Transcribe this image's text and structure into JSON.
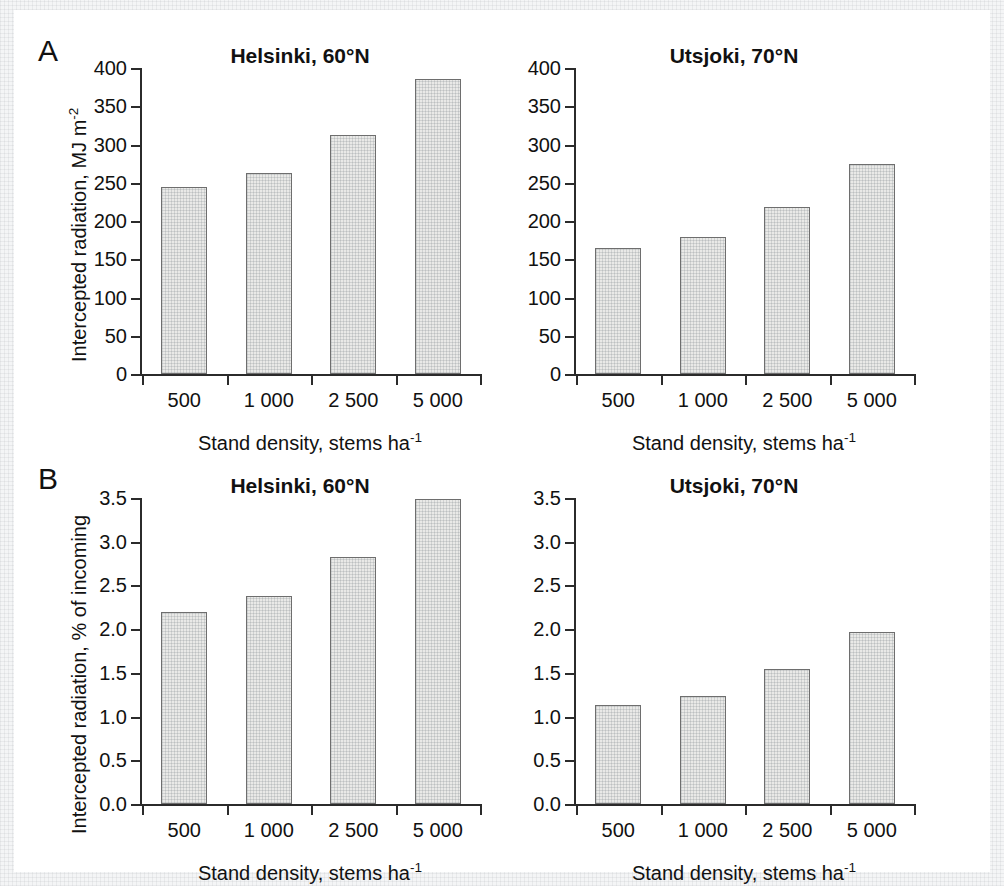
{
  "figure": {
    "panels": [
      {
        "letter": "A"
      },
      {
        "letter": "B"
      }
    ]
  },
  "axis_titles": {
    "x": "Stand density, stems ha",
    "x_sup": "-1",
    "y_a_pre": "Intercepted radiation, MJ m",
    "y_a_sup": "-2",
    "y_b": "Intercepted radiation, % of incoming"
  },
  "chart_data": [
    {
      "id": "a-helsinki",
      "panel": "A",
      "type": "bar",
      "title": "Helsinki, 60",
      "title_deg": "°N",
      "categories": [
        "500",
        "1 000",
        "2 500",
        "5 000"
      ],
      "values": [
        244,
        263,
        312,
        385
      ],
      "xlabel": "Stand density, stems ha-1",
      "ylabel": "Intercepted radiation, MJ m-2",
      "ylim": [
        0,
        400
      ],
      "yticks": [
        0,
        50,
        100,
        150,
        200,
        250,
        300,
        350,
        400
      ],
      "ytick_labels": [
        "0",
        "50",
        "100",
        "150",
        "200",
        "250",
        "300",
        "350",
        "400"
      ],
      "grid": false,
      "legend": "none",
      "bar_fill": "#e9e9e7",
      "bar_edge": "#6e6e6e"
    },
    {
      "id": "a-utsjoki",
      "panel": "A",
      "type": "bar",
      "title": "Utsjoki, 70",
      "title_deg": "°N",
      "categories": [
        "500",
        "1 000",
        "2 500",
        "5 000"
      ],
      "values": [
        165,
        179,
        218,
        275
      ],
      "xlabel": "Stand density, stems ha-1",
      "ylabel": "",
      "ylim": [
        0,
        400
      ],
      "yticks": [
        0,
        50,
        100,
        150,
        200,
        250,
        300,
        350,
        400
      ],
      "ytick_labels": [
        "0",
        "50",
        "100",
        "150",
        "200",
        "250",
        "300",
        "350",
        "400"
      ],
      "grid": false,
      "legend": "none",
      "bar_fill": "#e9e9e7",
      "bar_edge": "#6e6e6e"
    },
    {
      "id": "b-helsinki",
      "panel": "B",
      "type": "bar",
      "title": "Helsinki, 60",
      "title_deg": "°N",
      "categories": [
        "500",
        "1 000",
        "2 500",
        "5 000"
      ],
      "values": [
        2.2,
        2.38,
        2.82,
        3.49
      ],
      "xlabel": "Stand density, stems ha-1",
      "ylabel": "Intercepted radiation, % of incoming",
      "ylim": [
        0,
        3.5
      ],
      "yticks": [
        0,
        0.5,
        1.0,
        1.5,
        2.0,
        2.5,
        3.0,
        3.5
      ],
      "ytick_labels": [
        "0.0",
        "0.5",
        "1.0",
        "1.5",
        "2.0",
        "2.5",
        "3.0",
        "3.5"
      ],
      "grid": false,
      "legend": "none",
      "bar_fill": "#e9e9e7",
      "bar_edge": "#6e6e6e"
    },
    {
      "id": "b-utsjoki",
      "panel": "B",
      "type": "bar",
      "title": "Utsjoki, 70",
      "title_deg": "°N",
      "categories": [
        "500",
        "1 000",
        "2 500",
        "5 000"
      ],
      "values": [
        1.13,
        1.24,
        1.54,
        1.97
      ],
      "xlabel": "Stand density, stems ha-1",
      "ylabel": "",
      "ylim": [
        0,
        3.5
      ],
      "yticks": [
        0,
        0.5,
        1.0,
        1.5,
        2.0,
        2.5,
        3.0,
        3.5
      ],
      "ytick_labels": [
        "0.0",
        "0.5",
        "1.0",
        "1.5",
        "2.0",
        "2.5",
        "3.0",
        "3.5"
      ],
      "grid": false,
      "legend": "none",
      "bar_fill": "#e9e9e7",
      "bar_edge": "#6e6e6e"
    }
  ]
}
